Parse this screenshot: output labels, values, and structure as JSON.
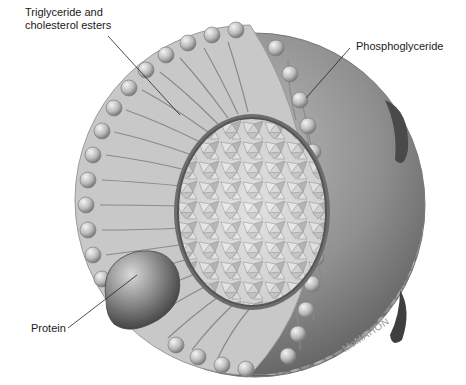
{
  "figure": {
    "labels": {
      "core": {
        "line1": "Triglyceride and",
        "line2": "cholesterol esters"
      },
      "shell": "Phosphoglyceride",
      "protein": "Protein"
    },
    "signature": "McMAHON",
    "colors": {
      "background": "#ffffff",
      "label_text": "#1a1a1a",
      "leader_line": "#222222",
      "shell_dark": "#6e6e6e",
      "shell_light": "#d6d6d6",
      "protein": "#5a5a5a",
      "signature": "#9a9a9a"
    }
  }
}
